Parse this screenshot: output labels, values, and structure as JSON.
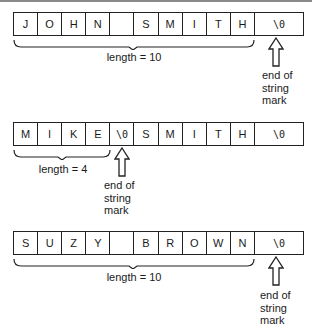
{
  "diagram": {
    "title": "",
    "rows": [
      {
        "cells": [
          "J",
          "O",
          "H",
          "N",
          "",
          "S",
          "M",
          "I",
          "T",
          "H"
        ],
        "terminator": "\\0",
        "length_label": "length = 10",
        "brace_cells": 10,
        "arrow_cell": "terminator",
        "mark_lines": [
          "end of",
          "string",
          "mark"
        ]
      },
      {
        "cells": [
          "M",
          "I",
          "K",
          "E",
          "\\0",
          "S",
          "M",
          "I",
          "T",
          "H"
        ],
        "terminator": "\\0",
        "length_label": "length = 4",
        "brace_cells": 4,
        "arrow_cell": 4,
        "mark_lines": [
          "end of",
          "string",
          "mark"
        ]
      },
      {
        "cells": [
          "S",
          "U",
          "Z",
          "Y",
          "",
          "B",
          "R",
          "O",
          "W",
          "N"
        ],
        "terminator": "\\0",
        "length_label": "length = 10",
        "brace_cells": 10,
        "arrow_cell": "terminator",
        "mark_lines": [
          "end of",
          "string",
          "mark"
        ]
      }
    ]
  }
}
